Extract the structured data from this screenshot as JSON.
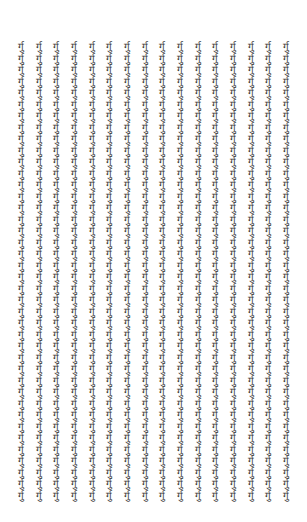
{
  "grid": {
    "glyph": "र्गु",
    "columns": 16,
    "rows": 40,
    "text_color": "#3a3a3a",
    "background": "#ffffff"
  }
}
